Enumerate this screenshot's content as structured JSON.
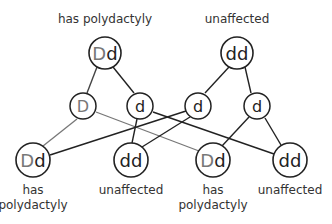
{
  "colors": {
    "dark": "#222222",
    "gray": "#777777",
    "label": "#333333"
  },
  "parents": [
    {
      "genotype": "Dd",
      "alleles": [
        "D",
        "d"
      ],
      "phenotype": "has polydactyly"
    },
    {
      "genotype": "dd",
      "alleles": [
        "d",
        "d"
      ],
      "phenotype": "unaffected"
    }
  ],
  "gametes": [
    {
      "allele": "D",
      "from": "parent-1"
    },
    {
      "allele": "d",
      "from": "parent-1"
    },
    {
      "allele": "d",
      "from": "parent-2"
    },
    {
      "allele": "d",
      "from": "parent-2"
    }
  ],
  "offspring": [
    {
      "genotype": "Dd",
      "alleles": [
        "D",
        "d"
      ],
      "phenotype_line1": "has",
      "phenotype_line2": "polydactyly"
    },
    {
      "genotype": "dd",
      "alleles": [
        "d",
        "d"
      ],
      "phenotype_line1": "unaffected",
      "phenotype_line2": ""
    },
    {
      "genotype": "Dd",
      "alleles": [
        "D",
        "d"
      ],
      "phenotype_line1": "has",
      "phenotype_line2": "polydactyly"
    },
    {
      "genotype": "dd",
      "alleles": [
        "d",
        "d"
      ],
      "phenotype_line1": "unaffected",
      "phenotype_line2": ""
    }
  ]
}
